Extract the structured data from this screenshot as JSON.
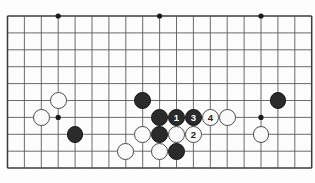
{
  "figure": {
    "name": "go-board-diagram",
    "watermark_text": "",
    "board": {
      "origin_x": 7.5,
      "origin_y": 16,
      "cell": 16.9,
      "cols": 19,
      "rows": 10,
      "line_color": "#5a5a5a",
      "border_color": "#3a3a3a",
      "background_color": "#fdfdfd",
      "star_color": "#1a1a1a",
      "star_radius": 2.6
    },
    "star_points": [
      {
        "name": "star-point-top-left",
        "col": 3,
        "row": 0
      },
      {
        "name": "star-point-top-center",
        "col": 9,
        "row": 0
      },
      {
        "name": "star-point-top-right",
        "col": 15,
        "row": 0
      },
      {
        "name": "star-point-mid-left",
        "col": 3,
        "row": 6
      },
      {
        "name": "star-point-mid-right",
        "col": 15,
        "row": 6
      }
    ],
    "stones": [
      {
        "name": "white-stone-left-upper",
        "color": "white",
        "col": 3,
        "row": 5,
        "label": ""
      },
      {
        "name": "white-stone-left-lower",
        "color": "white",
        "col": 2,
        "row": 6,
        "label": ""
      },
      {
        "name": "black-stone-left",
        "color": "black",
        "col": 4,
        "row": 7,
        "label": ""
      },
      {
        "name": "black-stone-center-top",
        "color": "black",
        "col": 8,
        "row": 5,
        "label": ""
      },
      {
        "name": "black-stone-center-left",
        "color": "black",
        "col": 9,
        "row": 6,
        "label": ""
      },
      {
        "name": "black-stone-move-1",
        "color": "black",
        "col": 10,
        "row": 6,
        "label": "1"
      },
      {
        "name": "black-stone-move-3",
        "color": "black",
        "col": 11,
        "row": 6,
        "label": "3"
      },
      {
        "name": "white-stone-move-4",
        "color": "white",
        "col": 12,
        "row": 6,
        "label": "4"
      },
      {
        "name": "white-stone-right-of-4",
        "color": "white",
        "col": 13,
        "row": 6,
        "label": ""
      },
      {
        "name": "white-stone-lower-left",
        "color": "white",
        "col": 8,
        "row": 7,
        "label": ""
      },
      {
        "name": "black-stone-lower-center",
        "color": "black",
        "col": 9,
        "row": 7,
        "label": ""
      },
      {
        "name": "white-stone-lower-mid",
        "color": "white",
        "col": 10,
        "row": 7,
        "label": ""
      },
      {
        "name": "white-stone-move-2",
        "color": "white",
        "col": 11,
        "row": 7,
        "label": "2"
      },
      {
        "name": "white-stone-bottom-left",
        "color": "white",
        "col": 7,
        "row": 8,
        "label": ""
      },
      {
        "name": "white-stone-bottom-mid",
        "color": "white",
        "col": 9,
        "row": 8,
        "label": ""
      },
      {
        "name": "black-stone-bottom",
        "color": "black",
        "col": 10,
        "row": 8,
        "label": ""
      },
      {
        "name": "black-stone-right",
        "color": "black",
        "col": 16,
        "row": 5,
        "label": ""
      },
      {
        "name": "white-stone-right",
        "color": "white",
        "col": 15,
        "row": 7,
        "label": ""
      }
    ],
    "move_sequence": [
      {
        "move": "1",
        "color": "black"
      },
      {
        "move": "2",
        "color": "white"
      },
      {
        "move": "3",
        "color": "black"
      },
      {
        "move": "4",
        "color": "white"
      }
    ]
  }
}
